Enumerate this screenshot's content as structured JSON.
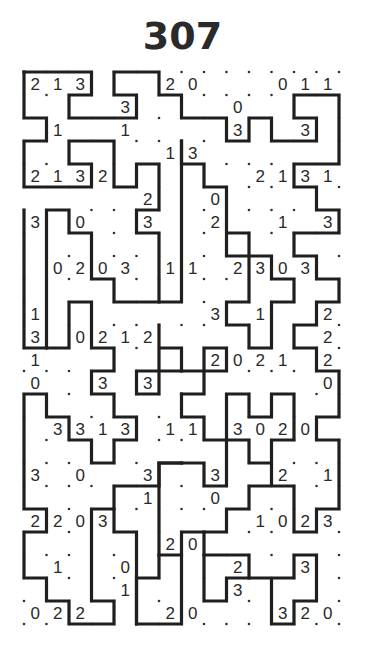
{
  "puzzle": {
    "number": "307",
    "type": "slitherlink",
    "cols": 14,
    "rows": 24,
    "colors": {
      "ink": "#1f1f1f",
      "text": "#2a2a2a",
      "background": "#ffffff"
    },
    "clues": [
      "213...20...011",
      "....3....0....",
      ".1..1....3..3.",
      "......13......",
      "2132......2131",
      ".....2..0.....",
      "3.0..3..2..1.3",
      "..............",
      ".0203.11.2303.",
      "..............",
      "1.......3.1..2",
      "3.0212.......2",
      "1.......2021.2",
      "0..3.3.......0",
      "..............",
      ".3313.11.3020.",
      "..............",
      "3.0..3..3..2.1",
      ".....1..0.....",
      "2203......1023",
      "......20......",
      ".1..0....2..3.",
      "....1....3....",
      "022...20...320"
    ],
    "loop": [
      [
        [
          0,
          0
        ],
        [
          3,
          0
        ],
        [
          3,
          1
        ],
        [
          2,
          1
        ],
        [
          2,
          2
        ],
        [
          5,
          2
        ],
        [
          5,
          1
        ],
        [
          4,
          1
        ],
        [
          4,
          0
        ],
        [
          6,
          0
        ],
        [
          6,
          1
        ],
        [
          7,
          1
        ],
        [
          7,
          2
        ],
        [
          9,
          2
        ],
        [
          9,
          3
        ],
        [
          10,
          3
        ],
        [
          10,
          2
        ],
        [
          11,
          2
        ],
        [
          11,
          3
        ],
        [
          13,
          3
        ],
        [
          13,
          2
        ],
        [
          12,
          2
        ],
        [
          12,
          1
        ],
        [
          14,
          1
        ],
        [
          14,
          4
        ],
        [
          12,
          4
        ],
        [
          12,
          5
        ],
        [
          13,
          5
        ],
        [
          13,
          6
        ],
        [
          14,
          6
        ],
        [
          14,
          7
        ],
        [
          12,
          7
        ],
        [
          12,
          8
        ],
        [
          13,
          8
        ],
        [
          13,
          9
        ],
        [
          14,
          9
        ],
        [
          14,
          10
        ],
        [
          13,
          10
        ],
        [
          13,
          11
        ],
        [
          12,
          11
        ],
        [
          12,
          12
        ],
        [
          13,
          12
        ],
        [
          13,
          13
        ],
        [
          14,
          13
        ],
        [
          14,
          15
        ],
        [
          13,
          15
        ],
        [
          13,
          16
        ],
        [
          14,
          16
        ],
        [
          14,
          19
        ],
        [
          13,
          19
        ],
        [
          13,
          20
        ],
        [
          12,
          20
        ],
        [
          12,
          18
        ],
        [
          11,
          18
        ],
        [
          11,
          16
        ],
        [
          12,
          16
        ],
        [
          12,
          14
        ],
        [
          11,
          14
        ],
        [
          11,
          15
        ],
        [
          10,
          15
        ],
        [
          10,
          14
        ],
        [
          9,
          14
        ],
        [
          9,
          16
        ],
        [
          10,
          16
        ],
        [
          10,
          17
        ],
        [
          11,
          17
        ],
        [
          11,
          18
        ],
        [
          10,
          18
        ],
        [
          10,
          19
        ],
        [
          9,
          19
        ],
        [
          9,
          20
        ],
        [
          8,
          20
        ],
        [
          8,
          21
        ],
        [
          10,
          21
        ],
        [
          10,
          22
        ],
        [
          11,
          22
        ],
        [
          11,
          24
        ],
        [
          12,
          24
        ],
        [
          12,
          23
        ],
        [
          13,
          23
        ],
        [
          13,
          21
        ],
        [
          12,
          21
        ],
        [
          12,
          22
        ],
        [
          11,
          22
        ]
      ],
      [
        [
          0,
          0
        ],
        [
          0,
          2
        ],
        [
          1,
          2
        ],
        [
          1,
          3
        ],
        [
          0,
          3
        ],
        [
          0,
          5
        ],
        [
          3,
          5
        ],
        [
          3,
          4
        ],
        [
          2,
          4
        ],
        [
          2,
          3
        ],
        [
          4,
          3
        ],
        [
          4,
          5
        ],
        [
          5,
          5
        ],
        [
          5,
          4
        ],
        [
          6,
          4
        ],
        [
          6,
          6
        ],
        [
          5,
          6
        ],
        [
          5,
          7
        ],
        [
          6,
          7
        ],
        [
          6,
          10
        ],
        [
          4,
          10
        ],
        [
          4,
          9
        ],
        [
          3,
          9
        ],
        [
          3,
          7
        ],
        [
          2,
          7
        ],
        [
          2,
          6
        ],
        [
          1,
          6
        ],
        [
          1,
          12
        ],
        [
          0,
          12
        ],
        [
          0,
          6
        ]
      ]
    ],
    "loop_extra": [
      [
        [
          7,
          3
        ],
        [
          7,
          4
        ],
        [
          8,
          4
        ],
        [
          8,
          5
        ],
        [
          9,
          5
        ],
        [
          9,
          7
        ],
        [
          10,
          7
        ],
        [
          10,
          10
        ],
        [
          9,
          10
        ],
        [
          9,
          11
        ],
        [
          10,
          11
        ],
        [
          10,
          12
        ],
        [
          11,
          12
        ],
        [
          11,
          10
        ],
        [
          12,
          10
        ],
        [
          12,
          9
        ],
        [
          11,
          9
        ],
        [
          11,
          8
        ],
        [
          9,
          8
        ],
        [
          9,
          7
        ]
      ],
      [
        [
          7,
          3
        ],
        [
          7,
          10
        ],
        [
          6,
          10
        ]
      ],
      [
        [
          6,
          11
        ],
        [
          6,
          12
        ],
        [
          7,
          12
        ],
        [
          7,
          13
        ],
        [
          5,
          13
        ],
        [
          5,
          14
        ],
        [
          6,
          14
        ],
        [
          6,
          11
        ]
      ],
      [
        [
          1,
          12
        ],
        [
          2,
          12
        ],
        [
          2,
          10
        ],
        [
          3,
          10
        ],
        [
          3,
          12
        ],
        [
          4,
          12
        ],
        [
          4,
          13
        ],
        [
          3,
          13
        ],
        [
          3,
          14
        ],
        [
          4,
          14
        ],
        [
          4,
          15
        ],
        [
          5,
          15
        ],
        [
          5,
          16
        ],
        [
          4,
          16
        ],
        [
          4,
          17
        ],
        [
          3,
          17
        ],
        [
          3,
          16
        ],
        [
          2,
          16
        ],
        [
          2,
          15
        ],
        [
          1,
          15
        ],
        [
          1,
          14
        ],
        [
          0,
          14
        ],
        [
          0,
          19
        ],
        [
          1,
          19
        ],
        [
          1,
          20
        ],
        [
          0,
          20
        ],
        [
          0,
          22
        ],
        [
          1,
          22
        ],
        [
          1,
          23
        ],
        [
          2,
          23
        ],
        [
          2,
          24
        ],
        [
          4,
          24
        ],
        [
          4,
          23
        ],
        [
          3,
          23
        ],
        [
          3,
          19
        ],
        [
          4,
          19
        ],
        [
          4,
          18
        ],
        [
          6,
          18
        ],
        [
          6,
          17
        ],
        [
          7,
          17
        ]
      ],
      [
        [
          7,
          14
        ],
        [
          8,
          14
        ],
        [
          8,
          13
        ],
        [
          9,
          13
        ],
        [
          9,
          12
        ],
        [
          8,
          12
        ],
        [
          8,
          13
        ],
        [
          7,
          13
        ]
      ],
      [
        [
          7,
          14
        ],
        [
          7,
          15
        ],
        [
          8,
          15
        ],
        [
          8,
          16
        ],
        [
          9,
          16
        ],
        [
          9,
          18
        ],
        [
          8,
          18
        ],
        [
          8,
          17
        ],
        [
          7,
          17
        ]
      ],
      [
        [
          7,
          17
        ],
        [
          6,
          17
        ],
        [
          6,
          21
        ],
        [
          7,
          21
        ],
        [
          7,
          20
        ],
        [
          8,
          20
        ]
      ],
      [
        [
          7,
          21
        ],
        [
          7,
          24
        ],
        [
          5,
          24
        ],
        [
          5,
          22
        ],
        [
          6,
          22
        ],
        [
          6,
          21
        ]
      ],
      [
        [
          5,
          24
        ],
        [
          5,
          20
        ],
        [
          4,
          20
        ],
        [
          4,
          19
        ]
      ],
      [
        [
          8,
          21
        ],
        [
          8,
          23
        ],
        [
          9,
          23
        ],
        [
          9,
          22
        ],
        [
          10,
          22
        ]
      ]
    ]
  }
}
